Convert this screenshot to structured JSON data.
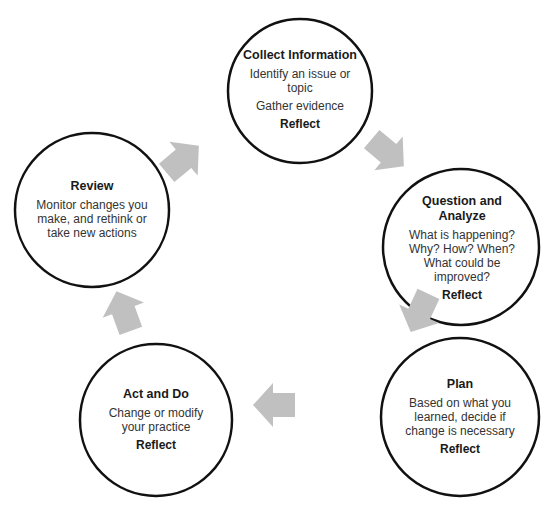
{
  "diagram": {
    "colors": {
      "circle_stroke": "#111111",
      "arrow_fill": "#c0c0c0",
      "background": "#ffffff"
    },
    "nodes": [
      {
        "id": "collect",
        "title": "Collect Information",
        "body": [
          "Identify an issue or topic",
          "Gather evidence"
        ],
        "reflect": "Reflect"
      },
      {
        "id": "question",
        "title": "Question and Analyze",
        "body": [
          "What is happening? Why? How? When? What could be improved?"
        ],
        "reflect": "Reflect"
      },
      {
        "id": "plan",
        "title": "Plan",
        "body": [
          "Based on what you learned, decide if change is necessary"
        ],
        "reflect": "Reflect"
      },
      {
        "id": "act",
        "title": "Act and Do",
        "body": [
          "Change or modify your practice"
        ],
        "reflect": "Reflect"
      },
      {
        "id": "review",
        "title": "Review",
        "body": [
          "Monitor changes you make, and rethink or take new actions"
        ],
        "reflect": ""
      }
    ],
    "arrows": [
      {
        "from": "collect",
        "to": "question",
        "icon": "arrow-down-right-icon"
      },
      {
        "from": "question",
        "to": "plan",
        "icon": "arrow-down-left-icon"
      },
      {
        "from": "plan",
        "to": "act",
        "icon": "arrow-left-icon"
      },
      {
        "from": "act",
        "to": "review",
        "icon": "arrow-up-left-icon"
      },
      {
        "from": "review",
        "to": "collect",
        "icon": "arrow-up-right-icon"
      }
    ]
  }
}
